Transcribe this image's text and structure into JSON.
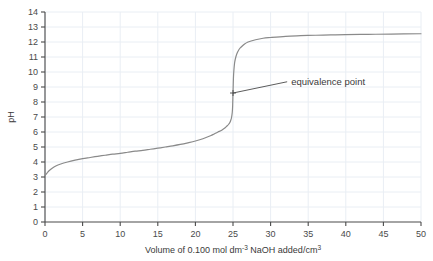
{
  "chart_data": {
    "type": "line",
    "title": "",
    "xlabel": "Volume of 0.100 mol dm-3 NaOH added/cm3",
    "xlabel_parts": {
      "pre_sup": "Volume of 0.100 mol dm",
      "sup": "-3",
      "mid": " NaOH added/cm",
      "sup2": "3"
    },
    "ylabel": "pH",
    "xlim": [
      0,
      50
    ],
    "ylim": [
      0,
      14
    ],
    "xticks": [
      0,
      5,
      10,
      15,
      20,
      25,
      30,
      35,
      40,
      45,
      50
    ],
    "yticks": [
      0,
      1,
      2,
      3,
      4,
      5,
      6,
      7,
      8,
      9,
      10,
      11,
      12,
      13,
      14
    ],
    "xtick_labels": [
      "0",
      "5",
      "10",
      "15",
      "20",
      "25",
      "30",
      "35",
      "40",
      "45",
      "50"
    ],
    "ytick_labels": [
      "0",
      "1",
      "2",
      "3",
      "4",
      "5",
      "6",
      "7",
      "8",
      "9",
      "10",
      "11",
      "12",
      "13",
      "14"
    ],
    "grid": true,
    "legend": "none",
    "series": [
      {
        "name": "titration curve",
        "color": "#8a8a8a",
        "x": [
          0,
          0.25,
          0.5,
          1,
          1.5,
          2,
          3,
          4,
          5,
          6,
          7,
          8,
          9,
          10,
          11,
          12,
          13,
          14,
          15,
          16,
          17,
          18,
          19,
          20,
          21,
          22,
          22.5,
          23,
          23.5,
          24,
          24.2,
          24.4,
          24.6,
          24.7,
          24.8,
          24.9,
          24.95,
          25,
          25.05,
          25.1,
          25.2,
          25.3,
          25.5,
          25.8,
          26,
          26.5,
          27,
          28,
          29,
          30,
          32,
          34,
          36,
          38,
          40,
          43,
          46,
          50
        ],
        "y": [
          3.1,
          3.25,
          3.4,
          3.6,
          3.75,
          3.85,
          4.0,
          4.12,
          4.22,
          4.3,
          4.38,
          4.45,
          4.52,
          4.58,
          4.65,
          4.72,
          4.78,
          4.85,
          4.92,
          5.0,
          5.08,
          5.17,
          5.28,
          5.4,
          5.55,
          5.75,
          5.87,
          6.0,
          6.12,
          6.3,
          6.4,
          6.5,
          6.65,
          6.78,
          6.95,
          7.3,
          7.7,
          8.6,
          9.5,
          10.0,
          10.55,
          10.85,
          11.2,
          11.5,
          11.62,
          11.85,
          12.0,
          12.15,
          12.25,
          12.3,
          12.38,
          12.42,
          12.45,
          12.47,
          12.49,
          12.51,
          12.53,
          12.55
        ]
      }
    ],
    "annotations": [
      {
        "label": "equivalence point",
        "point_x": 25,
        "point_y": 8.6,
        "text_x": 32.2,
        "text_y": 9.35,
        "marker": "cross"
      }
    ],
    "colors": {
      "curve": "#8a8a8a",
      "axis": "#4a4a4a",
      "grid": "#e9eef4",
      "text": "#3a3a3a",
      "annotation_line": "#4a4a4a",
      "background": "#ffffff"
    }
  }
}
